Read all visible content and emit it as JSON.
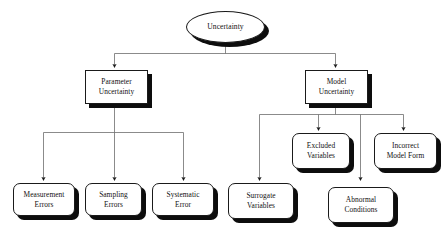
{
  "diagram": {
    "root": {
      "id": "uncertainty",
      "label": "Uncertainty",
      "shape": "ellipse"
    },
    "level1": [
      {
        "id": "parameter-uncertainty",
        "label": "Parameter\nUncertainty",
        "line1": "Parameter",
        "line2": "Uncertainty",
        "shape": "rectangle"
      },
      {
        "id": "model-uncertainty",
        "label": "Model\nUncertainty",
        "line1": "Model",
        "line2": "Uncertainty",
        "shape": "rectangle"
      }
    ],
    "parameter_children": [
      {
        "id": "measurement-errors",
        "line1": "Measurement",
        "line2": "Errors",
        "shape": "rounded-rectangle"
      },
      {
        "id": "sampling-errors",
        "line1": "Sampling",
        "line2": "Errors",
        "shape": "rounded-rectangle"
      },
      {
        "id": "systematic-error",
        "line1": "Systematic",
        "line2": "Error",
        "shape": "rounded-rectangle"
      }
    ],
    "model_children": [
      {
        "id": "surrogate-variables",
        "line1": "Surrogate",
        "line2": "Variables",
        "shape": "rounded-rectangle"
      },
      {
        "id": "excluded-variables",
        "line1": "Excluded",
        "line2": "Variables",
        "shape": "rounded-rectangle"
      },
      {
        "id": "abnormal-conditions",
        "line1": "Abnormal",
        "line2": "Conditions",
        "shape": "rounded-rectangle"
      },
      {
        "id": "incorrect-model-form",
        "line1": "Incorrect",
        "line2": "Model Form",
        "shape": "rounded-rectangle"
      }
    ],
    "colors": {
      "background": "#ffffff",
      "stroke": "#1a1a1a",
      "shadow": "#0d0d0d",
      "text": "#111111"
    }
  }
}
